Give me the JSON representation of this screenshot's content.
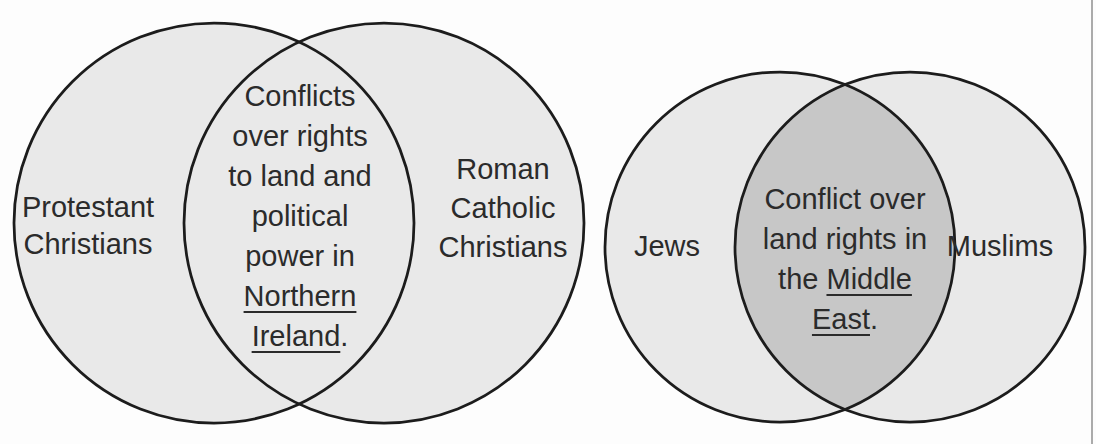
{
  "figure": {
    "type": "venn-diagram-pair",
    "background": "#fdfdfd"
  },
  "styles": {
    "circle_fill": "#e9e9e9",
    "overlap_fill_left": "#e9e9e9",
    "overlap_fill_right": "#c7c7c7",
    "circle_stroke": "#1c1c1c",
    "text_color": "#2b2b2b",
    "page_edge_color": "#ababab"
  },
  "venn_left": {
    "name": "Northern Ireland conflict venn",
    "left_set_label": {
      "line1": "Protestant",
      "line2": "Christians"
    },
    "right_set_label": {
      "line1": "Roman",
      "line2": "Catholic",
      "line3": "Christians"
    },
    "overlap_text": {
      "lines": [
        {
          "pre": "Conflicts",
          "u": "",
          "post": ""
        },
        {
          "pre": "over rights",
          "u": "",
          "post": ""
        },
        {
          "pre": "to land and",
          "u": "",
          "post": ""
        },
        {
          "pre": "political",
          "u": "",
          "post": ""
        },
        {
          "pre": "power in",
          "u": "",
          "post": ""
        },
        {
          "pre": "",
          "u": "Northern",
          "post": ""
        },
        {
          "pre": "",
          "u": "Ireland",
          "post": "."
        }
      ]
    }
  },
  "venn_right": {
    "name": "Middle East conflict venn",
    "left_set_label": {
      "line1": "Jews"
    },
    "right_set_label": {
      "line1": "Muslims"
    },
    "overlap_text": {
      "lines": [
        {
          "pre": "Conflict over",
          "u": "",
          "post": ""
        },
        {
          "pre": "land rights in",
          "u": "",
          "post": ""
        },
        {
          "pre": "the ",
          "u": "Middle",
          "post": ""
        },
        {
          "pre": "",
          "u": "East",
          "post": "."
        }
      ]
    }
  }
}
